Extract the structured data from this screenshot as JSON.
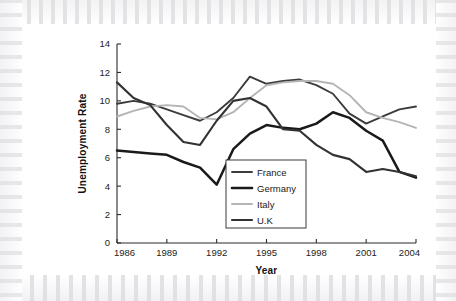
{
  "chart_data": {
    "type": "line",
    "title": "",
    "xlabel": "Year",
    "ylabel": "Unemployment Rate",
    "xlim": [
      1986,
      2004
    ],
    "ylim": [
      0,
      14
    ],
    "xticks": [
      1986,
      1989,
      1992,
      1995,
      1998,
      2001,
      2004
    ],
    "xtick_labels": [
      "1986",
      "1989",
      "1992",
      "1995",
      "1998",
      "2001",
      "2004"
    ],
    "yticks": [
      0,
      2,
      4,
      6,
      8,
      10,
      12,
      14
    ],
    "ytick_labels": [
      "0",
      "2",
      "4",
      "6",
      "8",
      "10",
      "12",
      "14"
    ],
    "grid": false,
    "legend_position": "center",
    "x": [
      1986,
      1987,
      1988,
      1989,
      1990,
      1991,
      1992,
      1993,
      1994,
      1995,
      1996,
      1997,
      1998,
      1999,
      2000,
      2001,
      2002,
      2003,
      2004
    ],
    "series": [
      {
        "name": "France",
        "color": "#3c3c3c",
        "width": 1.9,
        "values": [
          9.8,
          10.0,
          9.8,
          9.4,
          9.0,
          8.6,
          9.2,
          10.2,
          11.7,
          11.2,
          11.4,
          11.5,
          11.1,
          10.5,
          9.1,
          8.4,
          8.9,
          9.4,
          9.6
        ]
      },
      {
        "name": "Germany",
        "color": "#1a1a1a",
        "width": 2.5,
        "values": [
          6.5,
          6.4,
          6.3,
          6.2,
          5.7,
          5.3,
          4.1,
          6.6,
          7.7,
          8.3,
          8.1,
          8.0,
          8.4,
          9.2,
          8.8,
          7.9,
          7.2,
          5.0,
          4.6
        ]
      },
      {
        "name": "Italy",
        "color": "#b5b5b5",
        "width": 1.9,
        "values": [
          8.9,
          9.3,
          9.6,
          9.7,
          9.6,
          8.8,
          8.7,
          9.2,
          10.2,
          11.1,
          11.3,
          11.4,
          11.4,
          11.2,
          10.4,
          9.2,
          8.8,
          8.5,
          8.1
        ]
      },
      {
        "name": "U.K",
        "color": "#323232",
        "width": 2.1,
        "values": [
          11.3,
          10.2,
          9.7,
          8.3,
          7.1,
          6.9,
          8.6,
          10.0,
          10.2,
          9.6,
          8.0,
          7.9,
          6.9,
          6.2,
          5.9,
          5.0,
          5.2,
          5.0,
          4.7
        ]
      }
    ],
    "legend_entries": [
      {
        "label": "France",
        "color": "#3c3c3c",
        "width": 1.9
      },
      {
        "label": "Germany",
        "color": "#1a1a1a",
        "width": 2.6
      },
      {
        "label": "Italy",
        "color": "#b5b5b5",
        "width": 1.9
      },
      {
        "label": "U.K",
        "color": "#323232",
        "width": 2.1
      }
    ]
  }
}
